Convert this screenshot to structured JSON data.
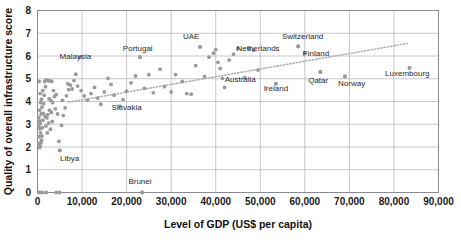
{
  "chart_data": {
    "type": "scatter",
    "title": "",
    "xlabel": "Level of GDP (US$ per capita)",
    "ylabel": "Quality of overall infrastructure score",
    "xlim": [
      0,
      90000
    ],
    "ylim": [
      0,
      8
    ],
    "xticks": [
      "0",
      "10,000",
      "20,000",
      "30,000",
      "40,000",
      "50,000",
      "60,000",
      "70,000",
      "80,000",
      "90,000"
    ],
    "xtick_values": [
      0,
      10000,
      20000,
      30000,
      40000,
      50000,
      60000,
      70000,
      80000,
      90000
    ],
    "yticks": [
      "0",
      "1",
      "2",
      "3",
      "4",
      "5",
      "6",
      "7",
      "8"
    ],
    "ytick_values": [
      0,
      1,
      2,
      3,
      4,
      5,
      6,
      7,
      8
    ],
    "grid": true,
    "legend": null,
    "marker_color": "#9a9a9a",
    "grid_color": "#b8b8c4",
    "axis_color": "#8a8a96",
    "trendline": {
      "style": "dotted",
      "color": "#b0b0b8",
      "x0": 7000,
      "y0": 3.97,
      "x1": 83000,
      "y1": 6.55
    },
    "annotations": [
      {
        "label": "Malaysia",
        "x": 9500,
        "y": 5.95,
        "lx": 8500,
        "ly": 6.02,
        "anchor": "middle"
      },
      {
        "label": "Portugal",
        "x": 23000,
        "y": 5.95,
        "lx": 22500,
        "ly": 6.33,
        "anchor": "middle"
      },
      {
        "label": "UAE",
        "x": 36500,
        "y": 6.4,
        "lx": 34500,
        "ly": 6.86,
        "anchor": "middle"
      },
      {
        "label": "Netherlands",
        "x": 47500,
        "y": 6.33,
        "lx": 49500,
        "ly": 6.33,
        "anchor": "middle"
      },
      {
        "label": "Switzerland",
        "x": 58500,
        "y": 6.42,
        "lx": 59500,
        "ly": 6.9,
        "anchor": "middle"
      },
      {
        "label": "Finland",
        "x": 60000,
        "y": 6.12,
        "lx": 62500,
        "ly": 6.12,
        "anchor": "middle"
      },
      {
        "label": "Australia",
        "x": 46500,
        "y": 5.05,
        "lx": 45500,
        "ly": 5.0,
        "anchor": "middle"
      },
      {
        "label": "Ireland",
        "x": 53500,
        "y": 4.78,
        "lx": 53500,
        "ly": 4.58,
        "anchor": "middle"
      },
      {
        "label": "Qatar",
        "x": 63500,
        "y": 5.3,
        "lx": 63000,
        "ly": 4.93,
        "anchor": "middle"
      },
      {
        "label": "Norway",
        "x": 69000,
        "y": 5.1,
        "lx": 70500,
        "ly": 4.82,
        "anchor": "middle"
      },
      {
        "label": "Luxembourg",
        "x": 83500,
        "y": 5.48,
        "lx": 83000,
        "ly": 5.25,
        "anchor": "middle"
      },
      {
        "label": "Slovakia",
        "x": 18500,
        "y": 3.78,
        "lx": 20000,
        "ly": 3.74,
        "anchor": "middle"
      },
      {
        "label": "Libya",
        "x": 5000,
        "y": 1.85,
        "lx": 7200,
        "ly": 1.5,
        "anchor": "middle"
      },
      {
        "label": "Brunei",
        "x": 23500,
        "y": 0.0,
        "lx": 23000,
        "ly": 0.52,
        "anchor": "middle"
      }
    ],
    "points": [
      [
        400,
        4.88
      ],
      [
        600,
        4.35
      ],
      [
        700,
        3.95
      ],
      [
        500,
        3.62
      ],
      [
        800,
        3.45
      ],
      [
        300,
        3.3
      ],
      [
        450,
        3.15
      ],
      [
        600,
        3.05
      ],
      [
        350,
        2.92
      ],
      [
        550,
        2.8
      ],
      [
        700,
        2.62
      ],
      [
        400,
        2.45
      ],
      [
        900,
        2.3
      ],
      [
        350,
        2.15
      ],
      [
        600,
        2.05
      ],
      [
        500,
        1.98
      ],
      [
        800,
        2.2
      ],
      [
        1000,
        2.48
      ],
      [
        1100,
        2.85
      ],
      [
        1200,
        3.18
      ],
      [
        1300,
        3.48
      ],
      [
        1000,
        3.75
      ],
      [
        1400,
        3.9
      ],
      [
        900,
        4.1
      ],
      [
        1500,
        4.28
      ],
      [
        1200,
        4.48
      ],
      [
        1800,
        4.65
      ],
      [
        1600,
        4.88
      ],
      [
        2000,
        4.95
      ],
      [
        2400,
        4.92
      ],
      [
        2800,
        4.9
      ],
      [
        3200,
        4.88
      ],
      [
        1700,
        3.35
      ],
      [
        2100,
        3.28
      ],
      [
        2500,
        3.05
      ],
      [
        1900,
        2.92
      ],
      [
        2300,
        3.42
      ],
      [
        2700,
        3.62
      ],
      [
        3100,
        3.52
      ],
      [
        2600,
        4.12
      ],
      [
        3000,
        4.05
      ],
      [
        3400,
        3.95
      ],
      [
        3800,
        4.22
      ],
      [
        3600,
        4.48
      ],
      [
        4200,
        4.3
      ],
      [
        4000,
        3.68
      ],
      [
        4500,
        3.45
      ],
      [
        3300,
        3.12
      ],
      [
        2900,
        2.78
      ],
      [
        2200,
        2.62
      ],
      [
        5000,
        1.85
      ],
      [
        4800,
        2.25
      ],
      [
        5400,
        2.95
      ],
      [
        5800,
        3.38
      ],
      [
        6200,
        3.72
      ],
      [
        5600,
        4.05
      ],
      [
        6500,
        4.25
      ],
      [
        7000,
        4.52
      ],
      [
        6800,
        4.78
      ],
      [
        7400,
        4.72
      ],
      [
        7800,
        4.55
      ],
      [
        8200,
        4.92
      ],
      [
        8600,
        5.2
      ],
      [
        9500,
        5.95
      ],
      [
        9000,
        4.68
      ],
      [
        9800,
        4.48
      ],
      [
        10500,
        4.25
      ],
      [
        11200,
        4.05
      ],
      [
        12000,
        4.35
      ],
      [
        12800,
        4.62
      ],
      [
        13500,
        4.15
      ],
      [
        14200,
        3.88
      ],
      [
        15000,
        4.42
      ],
      [
        15800,
        5.02
      ],
      [
        16500,
        4.75
      ],
      [
        17200,
        4.28
      ],
      [
        18500,
        3.78
      ],
      [
        19200,
        4.08
      ],
      [
        20000,
        4.45
      ],
      [
        21000,
        4.82
      ],
      [
        22000,
        5.12
      ],
      [
        23000,
        5.95
      ],
      [
        24000,
        4.58
      ],
      [
        25000,
        5.18
      ],
      [
        26000,
        4.38
      ],
      [
        27500,
        5.42
      ],
      [
        28500,
        4.65
      ],
      [
        30000,
        4.42
      ],
      [
        31000,
        5.18
      ],
      [
        32500,
        4.88
      ],
      [
        33500,
        4.35
      ],
      [
        34500,
        4.32
      ],
      [
        36500,
        6.4
      ],
      [
        35500,
        5.58
      ],
      [
        37500,
        5.1
      ],
      [
        38500,
        5.95
      ],
      [
        39500,
        6.12
      ],
      [
        40000,
        6.28
      ],
      [
        40500,
        5.72
      ],
      [
        41000,
        5.45
      ],
      [
        41500,
        5.02
      ],
      [
        42000,
        4.62
      ],
      [
        43000,
        5.82
      ],
      [
        44000,
        6.08
      ],
      [
        45000,
        6.32
      ],
      [
        46500,
        5.05
      ],
      [
        47500,
        6.33
      ],
      [
        48500,
        6.25
      ],
      [
        49500,
        5.38
      ],
      [
        53500,
        4.78
      ],
      [
        58500,
        6.42
      ],
      [
        60000,
        6.12
      ],
      [
        63500,
        5.3
      ],
      [
        69000,
        5.1
      ],
      [
        83500,
        5.48
      ],
      [
        1200,
        0.0
      ],
      [
        2000,
        0.0
      ],
      [
        4200,
        0.0
      ],
      [
        5000,
        0.0
      ],
      [
        23500,
        0.0
      ],
      [
        800,
        0.0
      ],
      [
        300,
        0.0
      ]
    ]
  }
}
